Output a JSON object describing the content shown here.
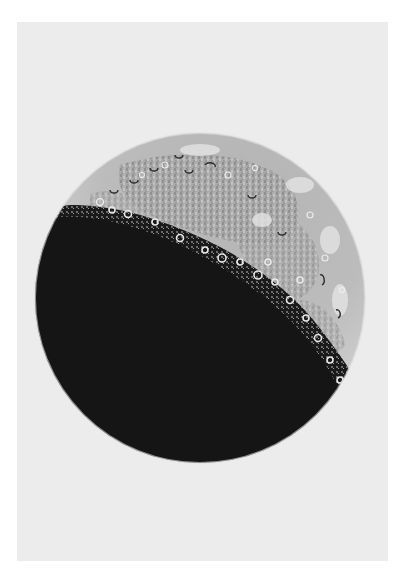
{
  "artwork": {
    "subject": "crescent moon illustration",
    "paper_color": "#ececec",
    "border_color": "#ffffff",
    "moon": {
      "center": [
        200,
        298
      ],
      "radius": 165,
      "shadow_color": "#151515",
      "lit_base_color": "#c8c8c8",
      "highland_color": "#dcdcdc",
      "maria_color": "#9c9c9c",
      "rim_color": "#d6d6d6"
    }
  }
}
